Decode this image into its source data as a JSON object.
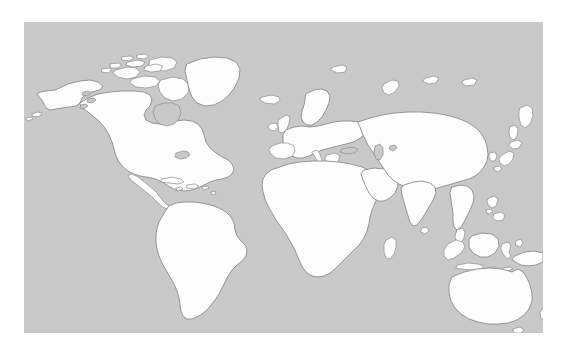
{
  "figure": {
    "kind": "world-map",
    "projection": "equirectangular-miller",
    "page_background": "#ffffff",
    "ocean_color": "#c9c9c9",
    "land_color": "#fdfdfd",
    "coastline_color": "#8c8c8c",
    "panel": {
      "left": 24,
      "top": 22,
      "width": 519,
      "height": 311
    },
    "labels": [],
    "legend": [],
    "graticule": false,
    "border": false
  },
  "regions": [
    {
      "id": "north-america",
      "name": "North America"
    },
    {
      "id": "greenland",
      "name": "Greenland"
    },
    {
      "id": "canadian-arctic",
      "name": "Canadian Arctic Archipelago"
    },
    {
      "id": "central-america",
      "name": "Central America"
    },
    {
      "id": "caribbean",
      "name": "Caribbean Islands"
    },
    {
      "id": "south-america",
      "name": "South America"
    },
    {
      "id": "europe",
      "name": "Europe"
    },
    {
      "id": "british-isles",
      "name": "British Isles"
    },
    {
      "id": "scandinavia",
      "name": "Scandinavia"
    },
    {
      "id": "iceland",
      "name": "Iceland"
    },
    {
      "id": "africa",
      "name": "Africa"
    },
    {
      "id": "madagascar",
      "name": "Madagascar"
    },
    {
      "id": "middle-east",
      "name": "Middle East"
    },
    {
      "id": "asia",
      "name": "Asia"
    },
    {
      "id": "siberia",
      "name": "Siberia"
    },
    {
      "id": "india",
      "name": "India"
    },
    {
      "id": "sri-lanka",
      "name": "Sri Lanka"
    },
    {
      "id": "japan",
      "name": "Japan"
    },
    {
      "id": "southeast-asia",
      "name": "Southeast Asia"
    },
    {
      "id": "philippines",
      "name": "Philippines"
    },
    {
      "id": "indonesia",
      "name": "Indonesia"
    },
    {
      "id": "borneo",
      "name": "Borneo"
    },
    {
      "id": "new-guinea",
      "name": "New Guinea"
    },
    {
      "id": "australia",
      "name": "Australia"
    },
    {
      "id": "tasmania",
      "name": "Tasmania"
    },
    {
      "id": "new-zealand",
      "name": "New Zealand"
    },
    {
      "id": "caspian-sea",
      "name": "Caspian Sea"
    },
    {
      "id": "great-lakes",
      "name": "Great Lakes"
    },
    {
      "id": "hudson-bay",
      "name": "Hudson Bay"
    }
  ]
}
